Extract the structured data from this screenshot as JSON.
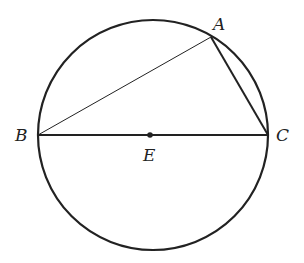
{
  "diagram": {
    "points": {
      "A": {
        "label": "A",
        "x": 211,
        "y": 37
      },
      "B": {
        "label": "B",
        "x": 38,
        "y": 135
      },
      "C": {
        "label": "C",
        "x": 268,
        "y": 135
      },
      "E": {
        "label": "E",
        "x": 150,
        "y": 135
      }
    },
    "circle": {
      "cx": 153,
      "cy": 135,
      "r": 115
    },
    "segments": [
      "AB",
      "AC",
      "BC"
    ],
    "stroke_color": "#222222"
  }
}
